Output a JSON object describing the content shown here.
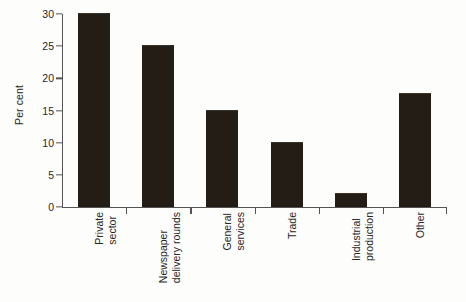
{
  "chart_data": {
    "type": "bar",
    "title": "",
    "xlabel": "",
    "ylabel": "Per cent",
    "categories": [
      "Private sector",
      "Newspaper delivery rounds",
      "General services",
      "Trade",
      "Industrial production",
      "Other"
    ],
    "category_lines": [
      [
        "Private",
        "sector"
      ],
      [
        "Newspaper",
        "delivery rounds"
      ],
      [
        "General",
        "services"
      ],
      [
        "Trade"
      ],
      [
        "Industrial",
        "production"
      ],
      [
        "Other"
      ]
    ],
    "values": [
      30,
      25,
      15,
      10,
      2,
      17.5
    ],
    "ylim": [
      0,
      30
    ],
    "yticks": [
      0,
      5,
      10,
      15,
      20,
      25,
      30
    ],
    "ytick_labels": [
      "0",
      "5",
      "10",
      "15",
      "20",
      "25",
      "30"
    ],
    "grid": false,
    "legend": null,
    "bar_color": "#231d15",
    "axis_color": "#545454",
    "background_color": "#fdfdfb"
  }
}
